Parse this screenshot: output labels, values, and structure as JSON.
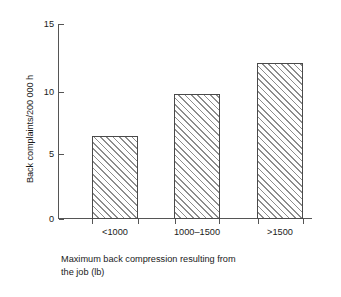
{
  "chart_data": {
    "type": "bar",
    "title": "",
    "subtitle": "",
    "categories": [
      "<1000",
      "1000–1500",
      ">1500"
    ],
    "values": [
      6.4,
      9.6,
      12.0
    ],
    "series": [
      {
        "name": "Back complaints/200 000 h",
        "values": [
          6.4,
          9.6,
          12.0
        ]
      }
    ],
    "xlabel_line1": "Maximum back compression resulting from",
    "xlabel_line2": "the job (lb)",
    "xlabel": "Maximum back compression resulting from the job (lb)",
    "ylabel": "Back complaints/200 000 h",
    "ylim": [
      0,
      15
    ],
    "yticks": [
      0,
      5,
      10,
      15
    ],
    "ytick_labels": [
      "0",
      "5",
      "10",
      "15"
    ],
    "grid": false,
    "legend": false,
    "legend_position": "none",
    "bar_fill": "hatched-diagonal",
    "colors": {
      "axis": "#555555",
      "bar_edge": "#4a4a4a",
      "bar_hatch": "#8d8d8d",
      "bar_face": "#ffffff",
      "text": "#1a1a1a",
      "background": "#ffffff"
    }
  }
}
